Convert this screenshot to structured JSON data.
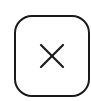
{
  "button": {
    "icon": "close-icon",
    "label": "Close",
    "stroke_color": "#1a1a1a",
    "background": "#ffffff"
  }
}
